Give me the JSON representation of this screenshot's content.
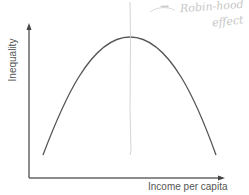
{
  "diagram": {
    "type": "kuznets-curve",
    "y_axis_label": "Inequality",
    "x_axis_label": "Income per capita",
    "annotation": {
      "arrow_glyph": "⇝",
      "line1": "Robin-hood",
      "line2": "effect"
    },
    "colors": {
      "axis": "#666666",
      "curve": "#555555",
      "pencil": "#cccccc"
    }
  }
}
